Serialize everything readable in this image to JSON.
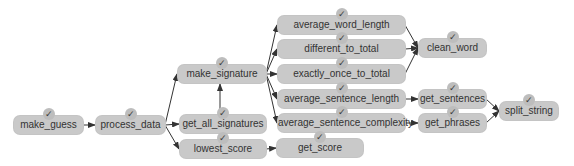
{
  "diagram": {
    "type": "call-graph",
    "colors": {
      "node_fill": "#c9c9c9",
      "text": "#333333",
      "edge": "#333333",
      "badge": "#bdbdbd"
    },
    "badge_glyph": "✓",
    "nodes": [
      {
        "id": "make_guess",
        "label": "make_guess",
        "x": 14,
        "y": 116,
        "w": 69
      },
      {
        "id": "process_data",
        "label": "process_data",
        "x": 96,
        "y": 116,
        "w": 69
      },
      {
        "id": "make_signature",
        "label": "make_signature",
        "x": 178,
        "y": 65,
        "w": 88
      },
      {
        "id": "get_all_signatures",
        "label": "get_all_signatures",
        "x": 180,
        "y": 115,
        "w": 86
      },
      {
        "id": "lowest_score",
        "label": "lowest_score",
        "x": 180,
        "y": 140,
        "w": 86
      },
      {
        "id": "average_word_length",
        "label": "average_word_length",
        "x": 278,
        "y": 16,
        "w": 127
      },
      {
        "id": "different_to_total",
        "label": "different_to_total",
        "x": 278,
        "y": 40,
        "w": 127
      },
      {
        "id": "exactly_once_to_total",
        "label": "exactly_once_to_total",
        "x": 278,
        "y": 65,
        "w": 127
      },
      {
        "id": "average_sentence_length",
        "label": "average_sentence_length",
        "x": 278,
        "y": 90,
        "w": 127
      },
      {
        "id": "average_sentence_complexity",
        "label": "average_sentence_complexity",
        "x": 278,
        "y": 114,
        "w": 127
      },
      {
        "id": "get_score",
        "label": "get_score",
        "x": 277,
        "y": 139,
        "w": 86
      },
      {
        "id": "clean_word",
        "label": "clean_word",
        "x": 419,
        "y": 39,
        "w": 67
      },
      {
        "id": "get_sentences",
        "label": "get_sentences",
        "x": 419,
        "y": 90,
        "w": 67
      },
      {
        "id": "get_phrases",
        "label": "get_phrases",
        "x": 419,
        "y": 114,
        "w": 67
      },
      {
        "id": "split_string",
        "label": "split_string",
        "x": 500,
        "y": 102,
        "w": 58
      }
    ],
    "edges": [
      [
        "make_guess",
        "process_data"
      ],
      [
        "process_data",
        "make_signature"
      ],
      [
        "process_data",
        "get_all_signatures"
      ],
      [
        "process_data",
        "lowest_score"
      ],
      [
        "get_all_signatures",
        "make_signature"
      ],
      [
        "make_signature",
        "average_word_length"
      ],
      [
        "make_signature",
        "different_to_total"
      ],
      [
        "make_signature",
        "exactly_once_to_total"
      ],
      [
        "make_signature",
        "average_sentence_length"
      ],
      [
        "make_signature",
        "average_sentence_complexity"
      ],
      [
        "lowest_score",
        "get_score"
      ],
      [
        "average_word_length",
        "clean_word"
      ],
      [
        "different_to_total",
        "clean_word"
      ],
      [
        "exactly_once_to_total",
        "clean_word"
      ],
      [
        "average_sentence_length",
        "get_sentences"
      ],
      [
        "average_sentence_complexity",
        "get_phrases"
      ],
      [
        "get_sentences",
        "split_string"
      ],
      [
        "get_phrases",
        "split_string"
      ]
    ]
  }
}
